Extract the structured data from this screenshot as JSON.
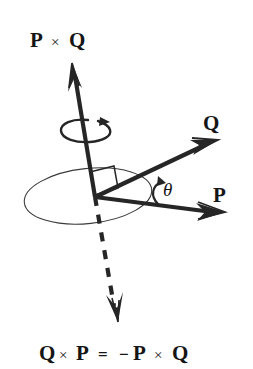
{
  "figure": {
    "title_label": "P × Q",
    "background_color": "#ffffff",
    "ink_color": "#262626",
    "width": 253,
    "height": 369
  },
  "labels": {
    "top_cross_product": {
      "first_vector": "P",
      "operator": "×",
      "second_vector": "Q"
    },
    "bottom_identity": {
      "first_vector": "Q",
      "operator_1": "×",
      "second_vector": "P",
      "equals": "=",
      "minus": "−",
      "third_vector": "P",
      "operator_2": "×",
      "fourth_vector": "Q"
    },
    "vector_q": "Q",
    "vector_p": "P",
    "angle": "θ"
  },
  "elements": {
    "up_vector_name": "p-cross-q-vector",
    "down_vector_name": "q-cross-p-vector",
    "plane_name": "pq-plane-ellipse",
    "rotation_name": "right-hand-rotation-arrow",
    "right_angle_name": "right-angle-marker"
  },
  "geometry": {
    "origin_x": 95,
    "origin_y": 197,
    "up_tip_x": 72,
    "up_tip_y": 63,
    "down_tip_x": 118,
    "down_tip_y": 322,
    "q_tip_x": 218,
    "q_tip_y": 140,
    "p_tip_x": 225,
    "p_tip_y": 212
  }
}
